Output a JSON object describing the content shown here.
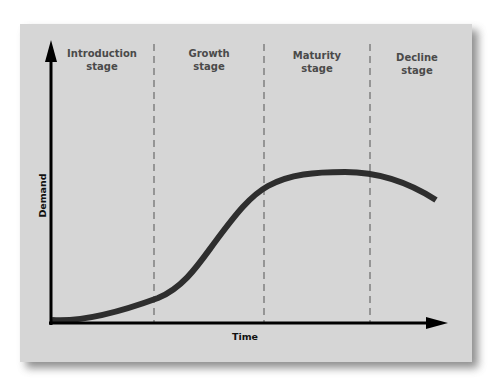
{
  "diagram": {
    "y_axis_label": "Demand",
    "x_axis_label": "Time",
    "stages": [
      {
        "line1": "Introduction",
        "line2": "stage"
      },
      {
        "line1": "Growth",
        "line2": "stage"
      },
      {
        "line1": "Maturity",
        "line2": "stage"
      },
      {
        "line1": "Decline",
        "line2": "stage"
      }
    ],
    "colors": {
      "background": "#d6d6d6",
      "curve": "#2e2e2e",
      "axes": "#000000",
      "stage_text": "#4a4a4a",
      "divider": "#555555"
    }
  }
}
